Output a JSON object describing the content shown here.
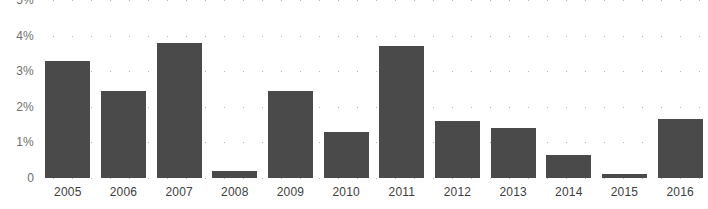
{
  "chart_data": {
    "type": "bar",
    "title": "",
    "subtitle": "",
    "xlabel": "",
    "ylabel": "",
    "categories": [
      "2005",
      "2006",
      "2007",
      "2008",
      "2009",
      "2010",
      "2011",
      "2012",
      "2013",
      "2014",
      "2015",
      "2016"
    ],
    "values": [
      3.3,
      2.45,
      3.8,
      0.2,
      2.45,
      1.3,
      3.7,
      1.6,
      1.4,
      0.65,
      0.1,
      1.65
    ],
    "series": [
      {
        "name": "",
        "values": [
          3.3,
          2.45,
          3.8,
          0.2,
          2.45,
          1.3,
          3.7,
          1.6,
          1.4,
          0.65,
          0.1,
          1.65
        ]
      }
    ],
    "ylim": [
      0,
      5
    ],
    "y_ticks": [
      0,
      1,
      2,
      3,
      4,
      5
    ],
    "y_tick_labels": [
      "0",
      "1%",
      "2%",
      "3%",
      "4%",
      "5%"
    ],
    "grid": true,
    "grid_style": "dotted-horizontal",
    "legend": false,
    "legend_position": "none",
    "annotations": [],
    "colors": {
      "bar": "#4a4a4a",
      "grid": "#b8b8b8",
      "background": "#ffffff",
      "y_tick_text": "#6e6e6e",
      "x_tick_text": "#3d3d3d"
    }
  }
}
